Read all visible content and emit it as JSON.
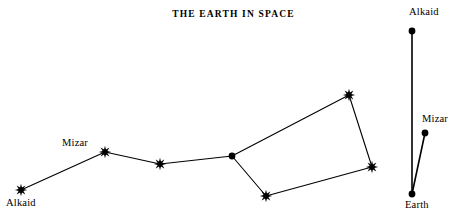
{
  "figure": {
    "title": "THE EARTH IN SPACE",
    "width": 467,
    "height": 214,
    "background_color": "#ffffff",
    "ink_color": "#000000"
  },
  "chart_data": {
    "type": "scatter",
    "title": "THE EARTH IN SPACE",
    "xlabel": "",
    "ylabel": "",
    "xlim": [
      0,
      467
    ],
    "ylim": [
      214,
      0
    ],
    "grid": false,
    "legend": null,
    "panels": [
      {
        "name": "big-dipper-asterism",
        "description": "Big Dipper (Ursa Major) plotted as seen from Earth",
        "nodes": [
          {
            "id": "alkaid",
            "label": "Alkaid",
            "x": 21,
            "y": 190,
            "marker": "star"
          },
          {
            "id": "mizar",
            "label": "Mizar",
            "x": 105,
            "y": 152,
            "marker": "star"
          },
          {
            "id": "alioth",
            "label": "",
            "x": 160,
            "y": 164,
            "marker": "star"
          },
          {
            "id": "megrez",
            "label": "",
            "x": 232,
            "y": 156,
            "marker": "dot"
          },
          {
            "id": "dubhe",
            "label": "",
            "x": 349,
            "y": 95,
            "marker": "star"
          },
          {
            "id": "merak",
            "label": "",
            "x": 372,
            "y": 167,
            "marker": "star"
          },
          {
            "id": "phecda",
            "label": "",
            "x": 266,
            "y": 196,
            "marker": "star"
          }
        ],
        "edges": [
          [
            "alkaid",
            "mizar"
          ],
          [
            "mizar",
            "alioth"
          ],
          [
            "alioth",
            "megrez"
          ],
          [
            "megrez",
            "dubhe"
          ],
          [
            "dubhe",
            "merak"
          ],
          [
            "merak",
            "phecda"
          ],
          [
            "phecda",
            "megrez"
          ]
        ]
      },
      {
        "name": "earth-sightline",
        "description": "Lines of sight from Earth to Alkaid and Mizar",
        "nodes": [
          {
            "id": "alkaid2",
            "label": "Alkaid",
            "x": 412,
            "y": 31,
            "marker": "dot"
          },
          {
            "id": "mizar2",
            "label": "Mizar",
            "x": 425,
            "y": 133,
            "marker": "dot"
          },
          {
            "id": "earth",
            "label": "Earth",
            "x": 412,
            "y": 194,
            "marker": "dot"
          }
        ],
        "edges": [
          [
            "earth",
            "alkaid2"
          ],
          [
            "earth",
            "mizar2"
          ]
        ]
      }
    ]
  },
  "labels": [
    {
      "name": "label-alkaid-left",
      "text": "Alkaid",
      "x": 6,
      "y": 197
    },
    {
      "name": "label-mizar-left",
      "text": "Mizar",
      "x": 62,
      "y": 137
    },
    {
      "name": "label-alkaid-right",
      "text": "Alkaid",
      "x": 409,
      "y": 6
    },
    {
      "name": "label-mizar-right",
      "text": "Mizar",
      "x": 422,
      "y": 113
    },
    {
      "name": "label-earth",
      "text": "Earth",
      "x": 405,
      "y": 199
    }
  ]
}
